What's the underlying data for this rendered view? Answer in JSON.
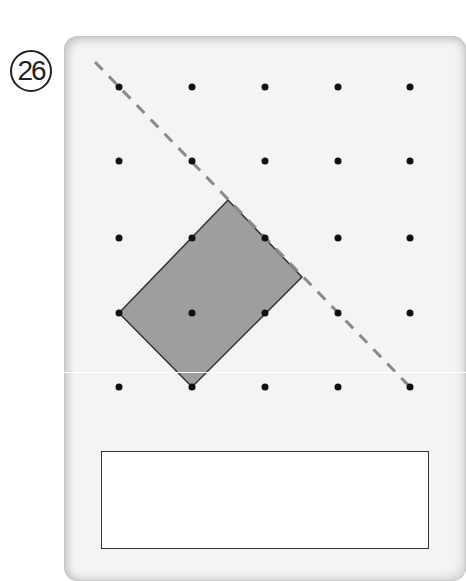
{
  "problem": {
    "number_label": "26"
  },
  "grid": {
    "cols_x": [
      119,
      192,
      265,
      338,
      410
    ],
    "rows_y": [
      87,
      161,
      238,
      313,
      387
    ],
    "dot_color": "#111111"
  },
  "shape": {
    "type": "rectangle",
    "vertices": [
      [
        228,
        200
      ],
      [
        302,
        277
      ],
      [
        192,
        387
      ],
      [
        119,
        313
      ]
    ],
    "fill": "#9e9e9e",
    "stroke": "#333333"
  },
  "symmetry_line": {
    "style": "dashed",
    "from": [
      95,
      62
    ],
    "to": [
      410,
      387
    ],
    "color": "#8a8a8a"
  },
  "answer_box": {
    "value": ""
  }
}
